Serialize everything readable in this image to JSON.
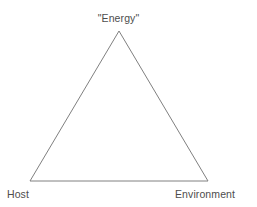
{
  "diagram": {
    "type": "triangle-diagram",
    "background_color": "#ffffff",
    "line_color": "#808080",
    "text_color": "#4d4d4d",
    "vertices": {
      "apex": {
        "x": 119,
        "y": 31
      },
      "bottom_left": {
        "x": 30,
        "y": 181
      },
      "bottom_right": {
        "x": 208,
        "y": 181
      }
    },
    "labels": {
      "apex": "\"Energy\"",
      "bottom_left": "Host",
      "bottom_right": "Environment"
    }
  }
}
